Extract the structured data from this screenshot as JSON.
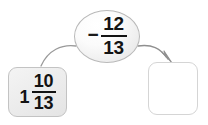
{
  "diagram": {
    "type": "arrow-flow-number-diagram",
    "background_color": "#ffffff",
    "operation_bubble": {
      "operator_symbol": "−",
      "operator_name": "minus-sign",
      "fraction": {
        "numerator": "12",
        "denominator": "13"
      },
      "expression": "− 12/13",
      "fill_color": "#ededed",
      "border_color": "#b9b9b9"
    },
    "left_box": {
      "label": "1 10/13",
      "whole": "1",
      "numerator": "10",
      "denominator": "13",
      "fill_color": "#ededed",
      "border_color": "#c3c3c3",
      "state": "filled"
    },
    "right_box": {
      "label": "",
      "fill_color": "#ffffff",
      "border_color": "#d5d5d5",
      "state": "empty"
    },
    "arrows": [
      {
        "name": "arrow-bubble-to-left-box",
        "from": "operation-bubble",
        "to": "left-box",
        "has_arrowhead": false,
        "color": "#9a9a9a"
      },
      {
        "name": "arrow-bubble-to-right-box",
        "from": "operation-bubble",
        "to": "right-box",
        "has_arrowhead": true,
        "color": "#8f8f8f"
      }
    ]
  }
}
